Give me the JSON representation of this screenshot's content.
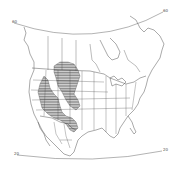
{
  "map": {
    "title": "",
    "region": "North America",
    "projection_labels": {
      "top_left": "60",
      "top_right": "60",
      "bottom_left": "20",
      "bottom_right": "20"
    },
    "legend": [],
    "range_area": {
      "description": "hatched distribution range",
      "style": "horizontal-hatch",
      "color": "#333333"
    },
    "colors": {
      "background": "#ffffff",
      "lines": "#555555",
      "hatch": "#333333"
    }
  }
}
